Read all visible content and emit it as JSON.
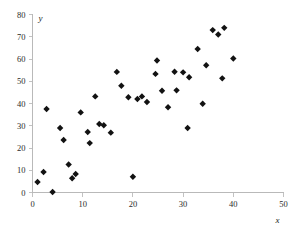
{
  "chart_data": {
    "type": "scatter",
    "title": "",
    "subtitle": "",
    "xlabel": "x",
    "ylabel": "y",
    "xlim": [
      0,
      50
    ],
    "ylim": [
      0,
      80
    ],
    "xticks": [
      0,
      10,
      20,
      30,
      40,
      50
    ],
    "yticks": [
      0,
      10,
      20,
      30,
      40,
      50,
      60,
      70,
      80
    ],
    "xtick_labels": [
      "0",
      "10",
      "20",
      "30",
      "40",
      "50"
    ],
    "ytick_labels": [
      "0",
      "10",
      "20",
      "30",
      "40",
      "50",
      "60",
      "70",
      "80"
    ],
    "grid": false,
    "legend": null,
    "legend_position": "none",
    "marker": {
      "shape": "diamond",
      "color": "#121212",
      "size": 3.2
    },
    "series": [
      {
        "name": "data",
        "points": [
          [
            1.0,
            4.7
          ],
          [
            2.2,
            9.2
          ],
          [
            2.8,
            37.5
          ],
          [
            4.0,
            0.2
          ],
          [
            5.5,
            29.0
          ],
          [
            6.2,
            23.6
          ],
          [
            7.2,
            12.6
          ],
          [
            7.9,
            6.4
          ],
          [
            8.6,
            8.3
          ],
          [
            9.6,
            36.0
          ],
          [
            11.0,
            27.2
          ],
          [
            11.4,
            22.2
          ],
          [
            12.5,
            43.2
          ],
          [
            13.3,
            30.8
          ],
          [
            14.2,
            30.2
          ],
          [
            15.6,
            26.9
          ],
          [
            16.8,
            54.2
          ],
          [
            17.7,
            48.0
          ],
          [
            19.1,
            42.8
          ],
          [
            20.0,
            7.1
          ],
          [
            20.9,
            42.0
          ],
          [
            21.8,
            43.2
          ],
          [
            22.8,
            40.7
          ],
          [
            24.5,
            53.3
          ],
          [
            24.8,
            59.3
          ],
          [
            25.8,
            45.7
          ],
          [
            27.0,
            38.3
          ],
          [
            28.3,
            54.3
          ],
          [
            28.7,
            45.9
          ],
          [
            30.0,
            54.0
          ],
          [
            30.9,
            29.0
          ],
          [
            31.2,
            51.8
          ],
          [
            32.9,
            64.5
          ],
          [
            33.9,
            39.9
          ],
          [
            34.6,
            57.2
          ],
          [
            35.9,
            73.0
          ],
          [
            37.0,
            71.0
          ],
          [
            37.8,
            51.3
          ],
          [
            38.2,
            74.0
          ],
          [
            40.0,
            60.2
          ]
        ]
      }
    ]
  },
  "axes": {
    "y_axis_title": "y",
    "x_axis_title": "x"
  },
  "colors": {
    "marker": "#121212",
    "axis": "#b9b9b9",
    "background": "#ffffff",
    "tick_text": "#2b2b2b"
  }
}
